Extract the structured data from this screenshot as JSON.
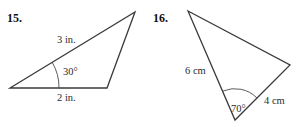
{
  "problems": [
    {
      "number": "15.",
      "shape": "triangle",
      "side_a_label": "3 in.",
      "side_b_label": "2 in.",
      "angle_label": "30°",
      "vertices": [
        [
          10,
          88
        ],
        [
          135,
          12
        ],
        [
          107,
          88
        ]
      ]
    },
    {
      "number": "16.",
      "shape": "triangle",
      "side_a_label": "6 cm",
      "side_b_label": "4 cm",
      "angle_label": "70°",
      "vertices": [
        [
          188,
          11
        ],
        [
          290,
          65
        ],
        [
          235,
          120
        ]
      ]
    }
  ],
  "colors": {
    "line": "#3a3a3a",
    "text": "#2b2b2b",
    "background": "#ffffff"
  }
}
